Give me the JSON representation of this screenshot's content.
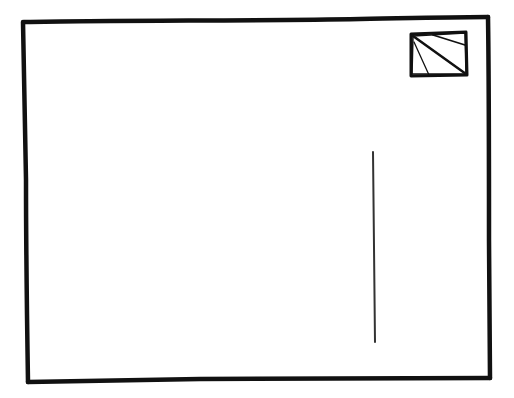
{
  "postcard": {
    "type": "hand-drawn postcard back sketch",
    "colors": {
      "ink": "#111111",
      "paper": "#ffffff",
      "divider": "#333333"
    },
    "border": {
      "x1": 22,
      "y1": 20,
      "x2": 491,
      "y2": 380
    },
    "stamp_box": {
      "x": 410,
      "y": 33,
      "width": 56,
      "height": 42
    },
    "divider_line": {
      "x1": 373,
      "y1": 152,
      "x2": 375,
      "y2": 342
    }
  }
}
